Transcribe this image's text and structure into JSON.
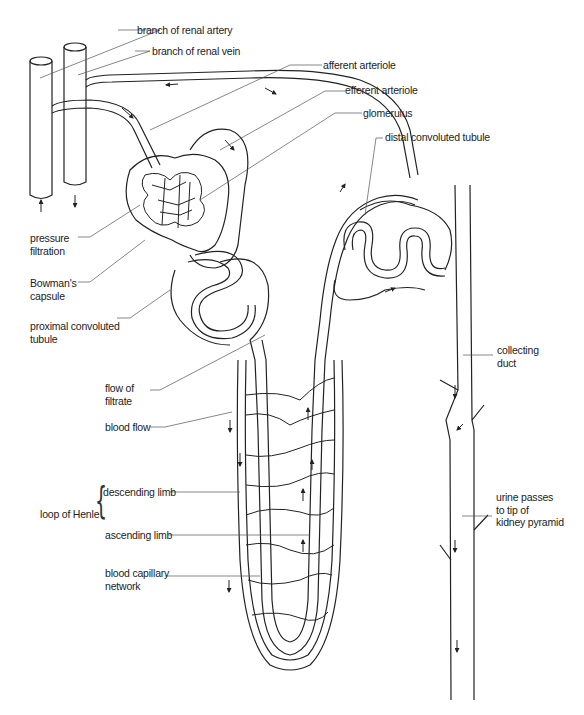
{
  "diagram": {
    "labels": {
      "renal_artery": "branch of renal artery",
      "renal_vein": "branch of renal vein",
      "afferent_arteriole": "afferent arteriole",
      "efferent_arteriole": "efferent arteriole",
      "glomerulus": "glomerulus",
      "distal_tubule": "distal convoluted tubule",
      "pressure_filtration": [
        "pressure",
        "filtration"
      ],
      "bowmans_capsule": [
        "Bowman's",
        "capsule"
      ],
      "proximal_tubule": [
        "proximal convoluted",
        "tubule"
      ],
      "flow_of_filtrate": [
        "flow of",
        "filtrate"
      ],
      "blood_flow": "blood flow",
      "loop_of_henle": "loop of Henle",
      "descending_limb": "descending limb",
      "ascending_limb": "ascending limb",
      "capillary_network": [
        "blood capillary",
        "network"
      ],
      "collecting_duct": [
        "collecting",
        "duct"
      ],
      "urine_passes": [
        "urine passes",
        "to tip of",
        "kidney pyramid"
      ]
    },
    "colors": {
      "line": "#222222",
      "leader": "#555555",
      "background": "#ffffff"
    }
  }
}
